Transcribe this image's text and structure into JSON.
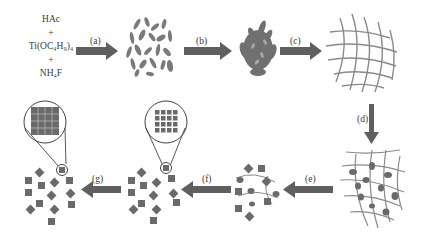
{
  "diagram": {
    "title": "",
    "reagents": [
      "HAc",
      "+",
      "Ti(OC₄H₉)₄",
      "+",
      "NH₄F"
    ],
    "steps": [
      {
        "id": "a",
        "label": "(a)",
        "from": "reagents",
        "to": "scattered nanosheets"
      },
      {
        "id": "b",
        "label": "(b)",
        "from": "scattered nanosheets",
        "to": "aggregated nanosheets"
      },
      {
        "id": "c",
        "label": "(c)",
        "from": "aggregated nanosheets",
        "to": "fiber network"
      },
      {
        "id": "d",
        "label": "(d)",
        "from": "fiber network",
        "to": "network with embedded particles"
      },
      {
        "id": "e",
        "label": "(e)",
        "from": "network with embedded particles",
        "to": "cubes and fibers"
      },
      {
        "id": "f",
        "label": "(f)",
        "from": "cubes and fibers",
        "to": "cube cluster with grid detail (gapped)"
      },
      {
        "id": "g",
        "label": "(g)",
        "from": "cube cluster with grid detail (gapped)",
        "to": "cube cluster with grid detail (dense)"
      }
    ],
    "colors": {
      "shape_fill": "#6e6e6e",
      "arrow_fill": "#5f5f5f",
      "fiber_stroke": "#8a8a8a",
      "outline": "#444444",
      "background": "#ffffff"
    }
  }
}
